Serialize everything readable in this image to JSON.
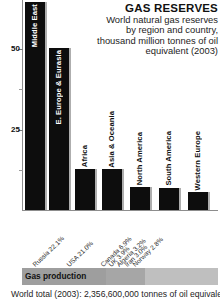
{
  "header": {
    "title": "GAS RESERVES",
    "subtitle": "World natural gas reserves by region and country, thousand million tonnes of oil equivalent (2003)"
  },
  "axis": {
    "major_ticks": [
      "50",
      "25"
    ]
  },
  "gas_production": {
    "label": "Gas production",
    "footnote": "World total (2003): 2,356,600,000 tonnes of oil equivalent"
  },
  "chart_data": {
    "type": "bar",
    "title": "GAS RESERVES",
    "subtitle": "World natural gas reserves by region and country, thousand million tonnes of oil equivalent (2003)",
    "xlabel": "",
    "ylabel": "thousand million tonnes of oil equivalent",
    "ylim": [
      0,
      65
    ],
    "yticks": [
      25,
      50
    ],
    "grid": false,
    "legend": false,
    "categories": [
      "Middle East",
      "E. Europe & Eurasia",
      "Africa",
      "Asia & Oceania",
      "North America",
      "South America",
      "Western Europe"
    ],
    "values": [
      64.0,
      50.0,
      12.5,
      12.5,
      7.0,
      6.8,
      5.5
    ],
    "bar_color": "#0d0d0d",
    "country_shares": {
      "unit": "percent of world total",
      "items": [
        {
          "name": "Russia",
          "value": 22.1,
          "label": "Russia 22.1%"
        },
        {
          "name": "USA",
          "value": 21.0,
          "label": "USA 21.0%"
        },
        {
          "name": "Canada",
          "value": 6.9,
          "label": "Canada 6.9%"
        },
        {
          "name": "UK",
          "value": 3.9,
          "label": "UK 3.9%"
        },
        {
          "name": "Algeria",
          "value": 3.2,
          "label": "Algeria 3.2%"
        },
        {
          "name": "Iran",
          "value": 3.0,
          "label": "Iran 3.0%"
        },
        {
          "name": "Norway",
          "value": 2.8,
          "label": "Norway 2.8%"
        }
      ]
    },
    "production_bar": {
      "label": "Gas production",
      "total_caption": "World total (2003): 2,356,600,000 tonnes of oil equivalent",
      "segments": [
        {
          "name": "Russia",
          "value": 22.1
        },
        {
          "name": "USA",
          "value": 21.0
        },
        {
          "name": "Canada",
          "value": 6.9
        },
        {
          "name": "UK",
          "value": 3.9
        },
        {
          "name": "Algeria",
          "value": 3.2
        },
        {
          "name": "Iran",
          "value": 3.0
        },
        {
          "name": "Norway",
          "value": 2.8
        },
        {
          "name": "Others",
          "value": 37.1
        }
      ]
    }
  }
}
